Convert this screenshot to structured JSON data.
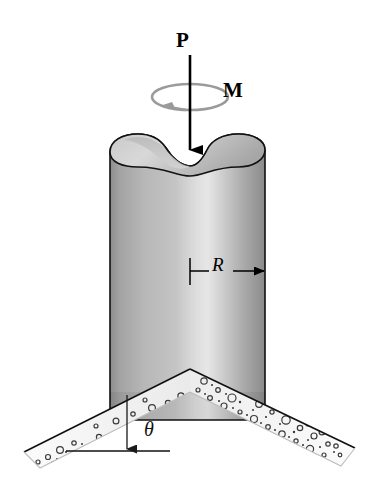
{
  "figure": {
    "background_color": "#ffffff",
    "width": 378,
    "height": 484
  },
  "labels": {
    "axial_load": "P",
    "moment": "M",
    "radius": "R",
    "angle": "θ"
  },
  "colors": {
    "outline": "#000000",
    "cylinder_light": "#e0e0e0",
    "cylinder_mid": "#b4b4b4",
    "cylinder_dark": "#8e8e8e",
    "cylinder_edge": "#7a7a7a",
    "top_face_light": "#d2d2d2",
    "top_face_dark": "#a8a8a8",
    "concrete_fill": "#f2f2f2",
    "concrete_top_edge": "#1a1a1a",
    "aggregate": "#3a3a3a",
    "moment_arc": "#9a9a9a"
  },
  "geometry": {
    "cylinder": {
      "left_x": 110,
      "right_x": 265,
      "top_y": 135,
      "bottom_y": 420,
      "radius_label_y": 271,
      "center_x": 190
    },
    "load_arrow": {
      "x": 190,
      "start_y": 55,
      "tip_y": 152
    },
    "moment_ellipse": {
      "cx": 190,
      "cy": 97,
      "rx": 38,
      "ry": 13
    },
    "chevron": {
      "apex_x": 190,
      "apex_y": 369,
      "left_tip_x": 24,
      "left_tip_y": 452,
      "right_tip_x": 355,
      "right_tip_y": 448,
      "thickness": 26
    },
    "angle_marker": {
      "vertex_x": 127,
      "vertex_y": 451,
      "incline_point_x": 127,
      "incline_point_y": 396,
      "baseline_x": 66,
      "baseline_y": 451
    }
  },
  "annotations": [
    {
      "name": "axial-load",
      "symbol": "P",
      "description": "downward axial force arrow on column axis"
    },
    {
      "name": "torque",
      "symbol": "M",
      "description": "torsional moment about the column axis, counterclockwise arc"
    },
    {
      "name": "radius",
      "symbol": "R",
      "description": "dimension from column axis to outer surface"
    },
    {
      "name": "incline-angle",
      "symbol": "θ",
      "description": "angle of concrete footing surface from the horizontal"
    }
  ]
}
